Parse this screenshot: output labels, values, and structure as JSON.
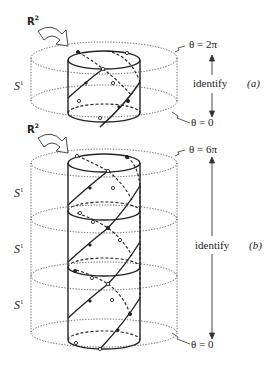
{
  "figure": {
    "panel_a": {
      "tag": "(a)",
      "plane_label": "R",
      "plane_exponent": "2",
      "circle_label": "S",
      "circle_exponent": "1",
      "top_label": "θ = 2π",
      "bottom_label": "θ = 0",
      "identify_label": "identify"
    },
    "panel_b": {
      "tag": "(b)",
      "plane_label": "R",
      "plane_exponent": "2",
      "circle_labels": [
        "S",
        "S",
        "S"
      ],
      "circle_exponent": "1",
      "top_label": "θ = 6π",
      "bottom_label": "θ = 0",
      "identify_label": "identify"
    }
  },
  "colors": {
    "ink": "#222222",
    "background": "#ffffff"
  }
}
